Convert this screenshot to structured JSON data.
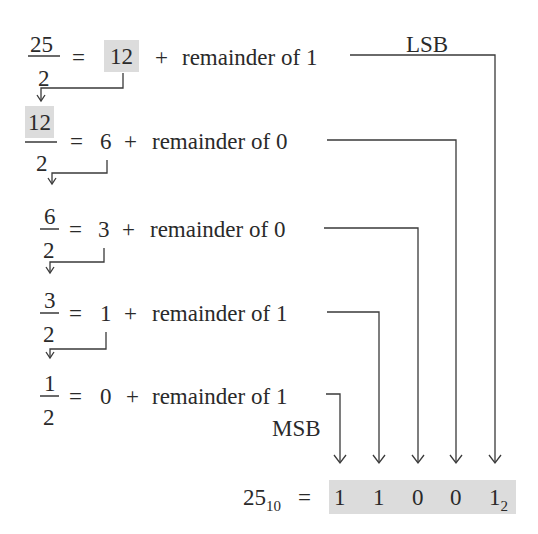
{
  "steps": [
    {
      "numerator": "25",
      "denominator": "2",
      "equals": "=",
      "quotient": "12",
      "plus": "+",
      "remainder_text": "remainder of 1",
      "remainder": 1
    },
    {
      "numerator": "12",
      "denominator": "2",
      "equals": "=",
      "quotient": "6",
      "plus": "+",
      "remainder_text": "remainder of 0",
      "remainder": 0
    },
    {
      "numerator": "6",
      "denominator": "2",
      "equals": "=",
      "quotient": "3",
      "plus": "+",
      "remainder_text": "remainder of 0",
      "remainder": 0
    },
    {
      "numerator": "3",
      "denominator": "2",
      "equals": "=",
      "quotient": "1",
      "plus": "+",
      "remainder_text": "remainder of 1",
      "remainder": 1
    },
    {
      "numerator": "1",
      "denominator": "2",
      "equals": "=",
      "quotient": "0",
      "plus": "+",
      "remainder_text": "remainder of 1",
      "remainder": 1
    }
  ],
  "labels": {
    "lsb": "LSB",
    "msb": "MSB"
  },
  "result": {
    "decimal": "25",
    "decimal_base": "10",
    "equals": "=",
    "bits": [
      "1",
      "1",
      "0",
      "0",
      "1"
    ],
    "binary_base": "2"
  },
  "colors": {
    "highlight": "#dcdcdc",
    "line": "#3a3a3a"
  }
}
